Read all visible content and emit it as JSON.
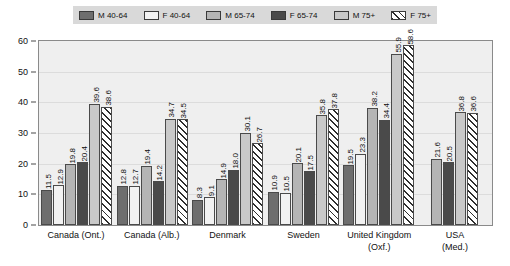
{
  "legend": {
    "items": [
      {
        "label": "M 40-64",
        "key": "m4064",
        "swatch": "legend-swatch-m-40-64"
      },
      {
        "label": "F 40-64",
        "key": "f4064",
        "swatch": "legend-swatch-f-40-64"
      },
      {
        "label": "M 65-74",
        "key": "m6574",
        "swatch": "legend-swatch-m-65-74"
      },
      {
        "label": "F 65-74",
        "key": "f6574",
        "swatch": "legend-swatch-f-65-74"
      },
      {
        "label": "M 75+",
        "key": "m75",
        "swatch": "legend-swatch-m-75-plus"
      },
      {
        "label": "F 75+",
        "key": "f75",
        "swatch": "legend-swatch-f-75-plus"
      }
    ]
  },
  "yticks": [
    "0",
    "10",
    "20",
    "30",
    "40",
    "50",
    "60"
  ],
  "chart_data": {
    "type": "bar",
    "title": "",
    "xlabel": "",
    "ylabel": "",
    "ylim": [
      0,
      60
    ],
    "ytick_step": 10,
    "grid": true,
    "legend_position": "top",
    "categories": [
      "Canada (Ont.)",
      "Canada (Alb.)",
      "Denmark",
      "Sweden",
      "United Kingdom (Oxf.)",
      "USA (Med.)"
    ],
    "category_lines": [
      [
        "Canada (Ont.)"
      ],
      [
        "Canada (Alb.)"
      ],
      [
        "Denmark"
      ],
      [
        "Sweden"
      ],
      [
        "United Kingdom",
        "(Oxf.)"
      ],
      [
        "USA",
        "(Med.)"
      ]
    ],
    "series": [
      {
        "name": "M 40-64",
        "key": "m4064",
        "color": "#6e6e6e",
        "values": [
          11.5,
          12.8,
          8.3,
          10.9,
          19.5,
          null
        ]
      },
      {
        "name": "F 40-64",
        "key": "f4064",
        "color": "#f2f2f2",
        "values": [
          12.9,
          12.7,
          9.1,
          10.5,
          23.3,
          null
        ]
      },
      {
        "name": "M 65-74",
        "key": "m6574",
        "color": "#b5b5b5",
        "values": [
          19.8,
          19.4,
          14.9,
          20.1,
          38.2,
          21.6
        ]
      },
      {
        "name": "F 65-74",
        "key": "f6574",
        "color": "#4a4a4a",
        "values": [
          20.4,
          14.2,
          18.0,
          17.5,
          34.4,
          20.5
        ]
      },
      {
        "name": "M 75+",
        "key": "m75",
        "color": "#c9c9c9",
        "values": [
          39.6,
          34.7,
          30.1,
          35.8,
          55.9,
          36.8
        ]
      },
      {
        "name": "F 75+",
        "key": "f75",
        "color": "#ffffff",
        "values": [
          38.6,
          34.5,
          26.7,
          37.8,
          58.6,
          36.6
        ]
      }
    ],
    "value_labels": [
      [
        "11.5",
        "12.9",
        "19.8",
        "20.4",
        "39.6",
        "38.6"
      ],
      [
        "12.8",
        "12.7",
        "19.4",
        "14.2",
        "34.7",
        "34.5"
      ],
      [
        "8.3",
        "9.1",
        "14.9",
        "18.0",
        "30.1",
        "26.7"
      ],
      [
        "10.9",
        "10.5",
        "20.1",
        "17.5",
        "35.8",
        "37.8"
      ],
      [
        "19.5",
        "23.3",
        "38.2",
        "34.4",
        "55.9",
        "58.6"
      ],
      [
        "",
        "",
        "21.6",
        "20.5",
        "36.8",
        "36.6"
      ]
    ]
  }
}
